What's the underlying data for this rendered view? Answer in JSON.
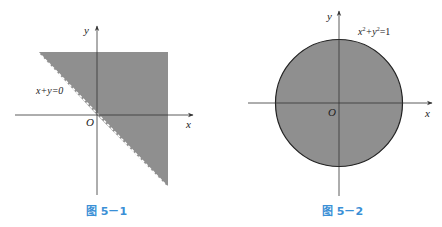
{
  "colors": {
    "region_fill": "#8f8f8f",
    "axis": "#333333",
    "caption": "#3a8fd6",
    "background": "#ffffff"
  },
  "figures": [
    {
      "caption": "图 5－1",
      "equation": "x+y=0",
      "axis_x_label": "x",
      "axis_y_label": "y",
      "origin_label": "O",
      "region": "half-plane x + y ≥ 0 (shaded), boundary dashed"
    },
    {
      "caption": "图 5－2",
      "equation_parts": [
        "x",
        "2",
        "+y",
        "2",
        "=1"
      ],
      "equation": "x²+y²=1",
      "axis_x_label": "x",
      "axis_y_label": "y",
      "origin_label": "O",
      "region": "disk x² + y² ≤ 1 (shaded), boundary solid"
    }
  ]
}
